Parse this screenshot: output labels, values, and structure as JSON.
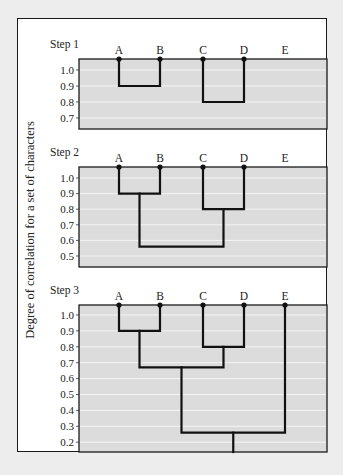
{
  "figure": {
    "y_axis_label": "Degree of correlation for a set of characters",
    "colors": {
      "plot_fill": "#dcdcdc",
      "line": "#111111",
      "frame": "#1a1a1a",
      "page_bg": "#ededed"
    }
  },
  "chart_data": {
    "type": "dendrogram",
    "ylabel": "Degree of correlation for a set of characters",
    "leaves": [
      "A",
      "B",
      "C",
      "D",
      "E"
    ],
    "panels": [
      {
        "title": "Step 1",
        "yticks": [
          "1.0",
          "0.9",
          "0.8",
          "0.7"
        ],
        "ylim": [
          0.65,
          1.07
        ],
        "joins": [
          {
            "members": [
              "A",
              "B"
            ],
            "height": 0.9
          },
          {
            "members": [
              "C",
              "D"
            ],
            "height": 0.8
          }
        ]
      },
      {
        "title": "Step 2",
        "yticks": [
          "1.0",
          "0.9",
          "0.8",
          "0.7",
          "0.6",
          "0.5"
        ],
        "ylim": [
          0.43,
          1.07
        ],
        "joins": [
          {
            "members": [
              "A",
              "B"
            ],
            "height": 0.9
          },
          {
            "members": [
              "C",
              "D"
            ],
            "height": 0.8
          },
          {
            "members": [
              "AB",
              "CD"
            ],
            "height": 0.56
          }
        ]
      },
      {
        "title": "Step 3",
        "yticks": [
          "1.0",
          "0.9",
          "0.8",
          "0.7",
          "0.6",
          "0.5",
          "0.4",
          "0.3",
          "0.2"
        ],
        "ylim": [
          0.13,
          1.07
        ],
        "joins": [
          {
            "members": [
              "A",
              "B"
            ],
            "height": 0.9
          },
          {
            "members": [
              "C",
              "D"
            ],
            "height": 0.8
          },
          {
            "members": [
              "AB",
              "CD"
            ],
            "height": 0.67
          },
          {
            "members": [
              "ABCD",
              "E"
            ],
            "height": 0.26
          }
        ]
      }
    ]
  }
}
